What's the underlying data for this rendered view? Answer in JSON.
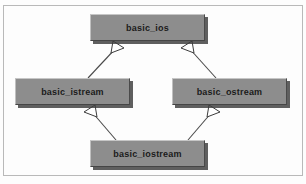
{
  "diagram": {
    "type": "uml-class-inheritance",
    "title": "",
    "frame": {
      "visible": true,
      "color": "#b9b9b9"
    },
    "style": {
      "box_fill": "#8d8d8d",
      "box_highlight": "#c6c6c6",
      "box_shadow": "#3c3c3c",
      "label_color": "#1b1b1b",
      "edge_color": "#4a4a4a",
      "arrowhead_fill": "#ffffff"
    },
    "nodes": [
      {
        "id": "basic_ios",
        "label": "basic_ios",
        "x": 90,
        "y": 14,
        "w": 115,
        "h": 27
      },
      {
        "id": "basic_istream",
        "label": "basic_istream",
        "x": 15,
        "y": 78,
        "w": 115,
        "h": 27
      },
      {
        "id": "basic_ostream",
        "label": "basic_ostream",
        "x": 172,
        "y": 78,
        "w": 115,
        "h": 27
      },
      {
        "id": "basic_iostream",
        "label": "basic_iostream",
        "x": 90,
        "y": 140,
        "w": 115,
        "h": 27
      }
    ],
    "edges": [
      {
        "from": "basic_istream",
        "to": "basic_ios",
        "relation": "generalization",
        "arrow": "hollow-triangle"
      },
      {
        "from": "basic_ostream",
        "to": "basic_ios",
        "relation": "generalization",
        "arrow": "hollow-triangle"
      },
      {
        "from": "basic_iostream",
        "to": "basic_istream",
        "relation": "generalization",
        "arrow": "hollow-triangle"
      },
      {
        "from": "basic_iostream",
        "to": "basic_ostream",
        "relation": "generalization",
        "arrow": "hollow-triangle"
      }
    ]
  }
}
